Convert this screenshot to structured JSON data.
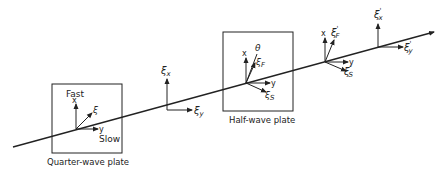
{
  "diagram": {
    "colors": {
      "ink": "#222222",
      "background": "#ffffff"
    },
    "quarter_wave_plate": {
      "label": "Quarter-wave plate",
      "fast_label": "Fast",
      "slow_label": "Slow",
      "x_label": "x",
      "y_label": "y",
      "xi_label": "ξ"
    },
    "free_frame_1": {
      "x_label": "ξ",
      "x_sub": "x",
      "y_label": "ξ",
      "y_sub": "y"
    },
    "half_wave_plate": {
      "label": "Half-wave plate",
      "x_label": "x",
      "y_label": "y",
      "theta_label": "θ",
      "f_label": "ξ",
      "f_sub": "F",
      "s_label": "ξ",
      "s_sub": "S"
    },
    "free_frame_2": {
      "x_label": "x",
      "y_label": "y",
      "f_label": "ξ",
      "f_sub": "F",
      "f_prime": "'",
      "s_label": "ξ",
      "s_sub": "S",
      "s_prime": "'"
    },
    "free_frame_3": {
      "x_label": "ξ",
      "x_sub": "x",
      "x_prime": "'",
      "y_label": "ξ",
      "y_sub": "y",
      "y_prime": "'"
    }
  }
}
